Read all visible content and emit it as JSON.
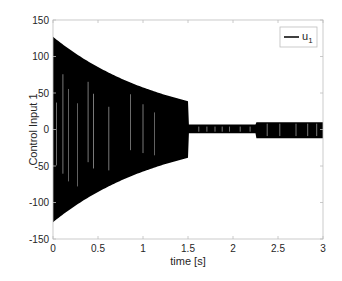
{
  "chart_data": {
    "type": "line",
    "title": "",
    "xlabel": "time [s]",
    "ylabel": "Control Input 1",
    "xlim": [
      0,
      3
    ],
    "ylim": [
      -150,
      150
    ],
    "xticks": [
      0,
      0.5,
      1,
      1.5,
      2,
      2.5,
      3
    ],
    "xtick_labels": [
      "0",
      "0.5",
      "1",
      "1.5",
      "2",
      "2.5",
      "3"
    ],
    "yticks": [
      -150,
      -100,
      -50,
      0,
      50,
      100,
      150
    ],
    "ytick_labels": [
      "-150",
      "-100",
      "-50",
      "0",
      "50",
      "100",
      "150"
    ],
    "grid": false,
    "legend": {
      "position": "upper right",
      "entries": [
        "u_1"
      ]
    },
    "series": [
      {
        "name": "u_1",
        "color": "#000000",
        "description": "High-frequency switching signal; envelope shown",
        "envelope_upper": [
          {
            "t": 0.0,
            "u": 127
          },
          {
            "t": 0.25,
            "u": 108
          },
          {
            "t": 0.5,
            "u": 92
          },
          {
            "t": 0.75,
            "u": 77
          },
          {
            "t": 1.0,
            "u": 64
          },
          {
            "t": 1.25,
            "u": 50
          },
          {
            "t": 1.5,
            "u": 39
          },
          {
            "t": 1.51,
            "u": 7
          },
          {
            "t": 2.25,
            "u": 7
          },
          {
            "t": 2.26,
            "u": 10
          },
          {
            "t": 3.0,
            "u": 10
          }
        ],
        "envelope_lower": [
          {
            "t": 0.0,
            "u": -127
          },
          {
            "t": 0.25,
            "u": -108
          },
          {
            "t": 0.5,
            "u": -92
          },
          {
            "t": 0.75,
            "u": -77
          },
          {
            "t": 1.0,
            "u": -64
          },
          {
            "t": 1.25,
            "u": -50
          },
          {
            "t": 1.5,
            "u": -39
          },
          {
            "t": 1.51,
            "u": -5
          },
          {
            "t": 2.25,
            "u": -5
          },
          {
            "t": 2.26,
            "u": -12
          },
          {
            "t": 3.0,
            "u": -12
          }
        ]
      }
    ]
  },
  "legend": {
    "label_main": "u",
    "label_sub": "1"
  },
  "axes": {
    "xlabel": "time [s]",
    "ylabel": "Control Input 1"
  }
}
